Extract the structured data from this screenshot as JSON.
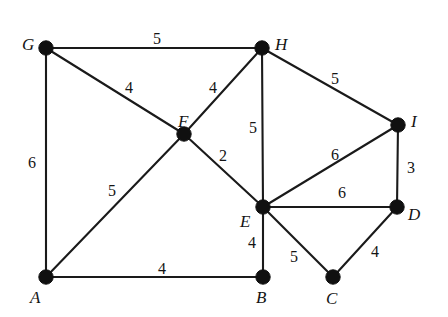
{
  "figure": {
    "type": "weighted-undirected-graph",
    "background_color": "#ffffff",
    "node_color": "#101010",
    "edge_color": "#1a1a1a",
    "label_color": "#141414"
  },
  "graph": {
    "nodes": [
      {
        "id": "A",
        "label": "A",
        "x": 46,
        "y": 277,
        "label_x": 30,
        "label_y": 289
      },
      {
        "id": "B",
        "label": "B",
        "x": 263,
        "y": 277,
        "label_x": 256,
        "label_y": 289
      },
      {
        "id": "C",
        "label": "C",
        "x": 333,
        "y": 277,
        "label_x": 326,
        "label_y": 290
      },
      {
        "id": "D",
        "label": "D",
        "x": 397,
        "y": 207,
        "label_x": 408,
        "label_y": 206
      },
      {
        "id": "E",
        "label": "E",
        "x": 263,
        "y": 207,
        "label_x": 240,
        "label_y": 213
      },
      {
        "id": "F",
        "label": "F",
        "x": 184,
        "y": 134,
        "label_x": 178,
        "label_y": 113
      },
      {
        "id": "G",
        "label": "G",
        "x": 46,
        "y": 48,
        "label_x": 22,
        "label_y": 36
      },
      {
        "id": "H",
        "label": "H",
        "x": 262,
        "y": 48,
        "label_x": 275,
        "label_y": 36
      },
      {
        "id": "I",
        "label": "I",
        "x": 398,
        "y": 125,
        "label_x": 411,
        "label_y": 113
      }
    ],
    "edges": [
      {
        "from": "G",
        "to": "H",
        "weight": "5",
        "label_x": 153,
        "label_y": 31
      },
      {
        "from": "G",
        "to": "F",
        "weight": "4",
        "label_x": 125,
        "label_y": 80
      },
      {
        "from": "G",
        "to": "A",
        "weight": "6",
        "label_x": 28,
        "label_y": 155
      },
      {
        "from": "H",
        "to": "F",
        "weight": "4",
        "label_x": 209,
        "label_y": 80
      },
      {
        "from": "H",
        "to": "E",
        "weight": "5",
        "label_x": 249,
        "label_y": 120
      },
      {
        "from": "H",
        "to": "I",
        "weight": "5",
        "label_x": 331,
        "label_y": 71
      },
      {
        "from": "F",
        "to": "E",
        "weight": "2",
        "label_x": 219,
        "label_y": 148
      },
      {
        "from": "F",
        "to": "A",
        "weight": "5",
        "label_x": 108,
        "label_y": 183
      },
      {
        "from": "A",
        "to": "B",
        "weight": "4",
        "label_x": 158,
        "label_y": 261
      },
      {
        "from": "B",
        "to": "E",
        "weight": "4",
        "label_x": 248,
        "label_y": 235
      },
      {
        "from": "E",
        "to": "I",
        "weight": "6",
        "label_x": 331,
        "label_y": 147
      },
      {
        "from": "E",
        "to": "D",
        "weight": "6",
        "label_x": 338,
        "label_y": 185
      },
      {
        "from": "E",
        "to": "C",
        "weight": "5",
        "label_x": 290,
        "label_y": 249
      },
      {
        "from": "C",
        "to": "D",
        "weight": "4",
        "label_x": 371,
        "label_y": 244
      },
      {
        "from": "I",
        "to": "D",
        "weight": "3",
        "label_x": 407,
        "label_y": 160
      }
    ]
  }
}
